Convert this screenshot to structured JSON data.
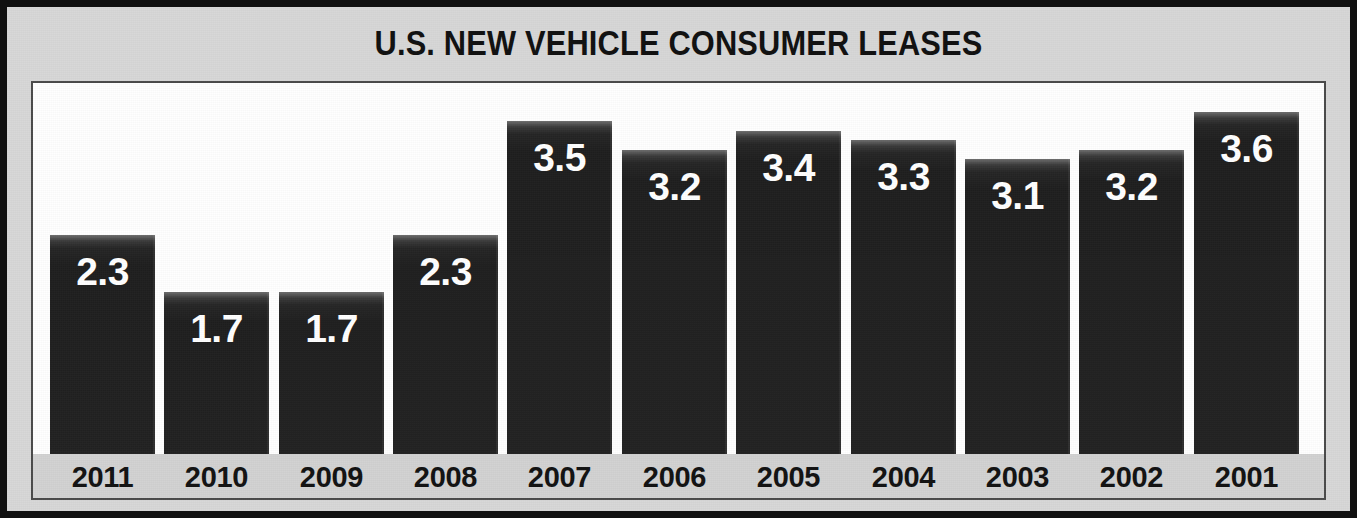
{
  "figure": {
    "title": "U.S. NEW VEHICLE CONSUMER LEASES",
    "border_color": "#101010",
    "panel_color": "#d7d7d7",
    "plot_background": "#ffffff",
    "axis_strip_color": "#d2d2d2",
    "bar_color": "#232323",
    "value_label_color": "#ffffff",
    "year_label_color": "#121212"
  },
  "chart_data": {
    "type": "bar",
    "title": "U.S. NEW VEHICLE CONSUMER LEASES",
    "xlabel": "",
    "ylabel": "",
    "ylim": [
      0,
      3.9
    ],
    "grid": false,
    "legend": null,
    "orientation": "vertical",
    "category_order": "descending-year",
    "categories": [
      "2011",
      "2010",
      "2009",
      "2008",
      "2007",
      "2006",
      "2005",
      "2004",
      "2003",
      "2002",
      "2001"
    ],
    "values": [
      2.3,
      1.7,
      1.7,
      2.3,
      3.5,
      3.2,
      3.4,
      3.3,
      3.1,
      3.2,
      3.6
    ],
    "value_labels": [
      "2.3",
      "1.7",
      "1.7",
      "2.3",
      "3.5",
      "3.2",
      "3.4",
      "3.3",
      "3.1",
      "3.2",
      "3.6"
    ],
    "bars": [
      {
        "category": "2011",
        "value": 2.3,
        "label": "2.3"
      },
      {
        "category": "2010",
        "value": 1.7,
        "label": "1.7"
      },
      {
        "category": "2009",
        "value": 1.7,
        "label": "1.7"
      },
      {
        "category": "2008",
        "value": 2.3,
        "label": "2.3"
      },
      {
        "category": "2007",
        "value": 3.5,
        "label": "3.5"
      },
      {
        "category": "2006",
        "value": 3.2,
        "label": "3.2"
      },
      {
        "category": "2005",
        "value": 3.4,
        "label": "3.4"
      },
      {
        "category": "2004",
        "value": 3.3,
        "label": "3.3"
      },
      {
        "category": "2003",
        "value": 3.1,
        "label": "3.1"
      },
      {
        "category": "2002",
        "value": 3.2,
        "label": "3.2"
      },
      {
        "category": "2001",
        "value": 3.6,
        "label": "3.6"
      }
    ]
  }
}
